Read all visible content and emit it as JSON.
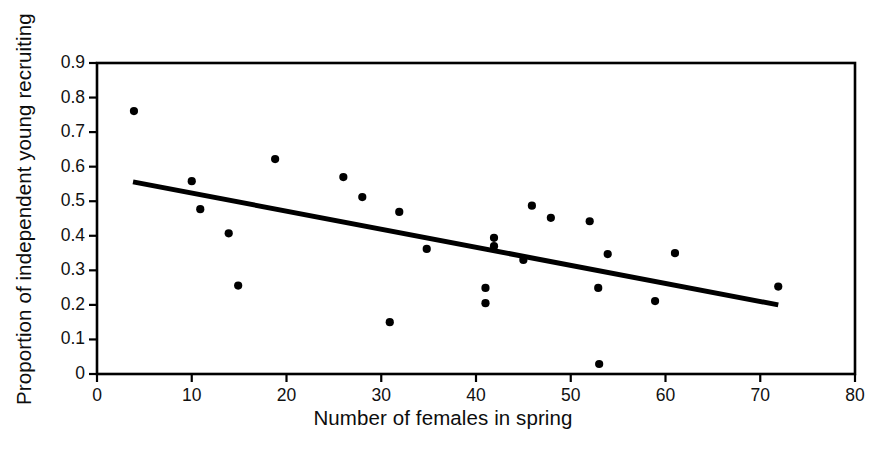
{
  "chart_data": {
    "type": "scatter",
    "title": "",
    "xlabel": "Number of females in spring",
    "ylabel": "Proportion of independent young recruiting",
    "xlim": [
      0,
      80
    ],
    "ylim": [
      0,
      0.9
    ],
    "xticks": [
      "0",
      "10",
      "20",
      "30",
      "40",
      "50",
      "60",
      "70",
      "80"
    ],
    "xtick_values": [
      0,
      10,
      20,
      30,
      40,
      50,
      60,
      70,
      80
    ],
    "yticks": [
      "0",
      "0.1",
      "0.2",
      "0.3",
      "0.4",
      "0.5",
      "0.6",
      "0.7",
      "0.8",
      "0.9"
    ],
    "ytick_values": [
      0,
      0.1,
      0.2,
      0.3,
      0.4,
      0.5,
      0.6,
      0.7,
      0.8,
      0.9
    ],
    "grid": false,
    "legend": "none",
    "frame": "box",
    "marker": "filled-circle",
    "marker_color": "#000000",
    "marker_size_px": 7,
    "points": [
      {
        "x": 3.9,
        "y": 0.761
      },
      {
        "x": 10.0,
        "y": 0.558
      },
      {
        "x": 10.9,
        "y": 0.477
      },
      {
        "x": 13.9,
        "y": 0.407
      },
      {
        "x": 14.9,
        "y": 0.256
      },
      {
        "x": 18.8,
        "y": 0.622
      },
      {
        "x": 26.0,
        "y": 0.57
      },
      {
        "x": 28.0,
        "y": 0.512
      },
      {
        "x": 30.9,
        "y": 0.15
      },
      {
        "x": 31.9,
        "y": 0.469
      },
      {
        "x": 34.8,
        "y": 0.362
      },
      {
        "x": 41.0,
        "y": 0.249
      },
      {
        "x": 41.0,
        "y": 0.205
      },
      {
        "x": 41.9,
        "y": 0.394
      },
      {
        "x": 41.9,
        "y": 0.37
      },
      {
        "x": 45.0,
        "y": 0.33
      },
      {
        "x": 45.9,
        "y": 0.487
      },
      {
        "x": 47.9,
        "y": 0.452
      },
      {
        "x": 52.0,
        "y": 0.442
      },
      {
        "x": 52.9,
        "y": 0.249
      },
      {
        "x": 53.0,
        "y": 0.029
      },
      {
        "x": 53.9,
        "y": 0.347
      },
      {
        "x": 58.9,
        "y": 0.211
      },
      {
        "x": 61.0,
        "y": 0.35
      },
      {
        "x": 71.9,
        "y": 0.253
      }
    ],
    "trendline": {
      "type": "linear-fit",
      "color": "#000000",
      "width_px": 5,
      "x_start": 3.8,
      "y_start": 0.556,
      "x_end": 71.9,
      "y_end": 0.2
    }
  }
}
